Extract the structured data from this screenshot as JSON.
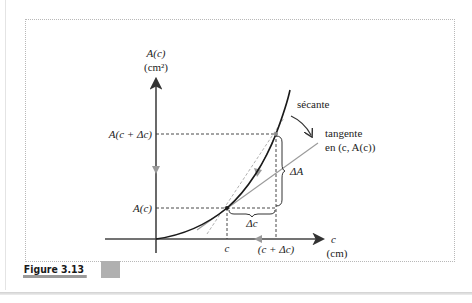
{
  "figure": {
    "caption": "Figure 3.13",
    "y_axis_label": "A(c)",
    "y_axis_unit": "(cm²)",
    "x_axis_label": "c",
    "x_axis_unit": "(cm)",
    "y_tick_upper": "A(c + Δc)",
    "y_tick_lower": "A(c)",
    "x_tick_left": "c",
    "x_tick_right": "(c + Δc)",
    "secant_label": "sécante",
    "tangent_label_line1": "tangente",
    "tangent_label_line2": "en (c, A(c))",
    "delta_a_label": "ΔA",
    "delta_c_label": "Δc"
  },
  "colors": {
    "axis": "#333333",
    "curve": "#1a1a1a",
    "tangent": "#9a9a9a",
    "secant": "#b8b8b8",
    "dashed": "#333333",
    "arrow_gray": "#999999"
  }
}
